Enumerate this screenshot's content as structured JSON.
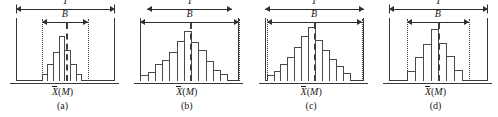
{
  "figure": {
    "title": "",
    "axis_label_mean": "X",
    "axis_label_paren_open": "(",
    "axis_label_m": "M",
    "axis_label_paren_close": ")",
    "tolerance_label": "T",
    "spread_label": "B"
  },
  "chart_data": {
    "type": "bar",
    "title": "",
    "xlabel": "X̄ (M)",
    "ylabel": "",
    "grid": false,
    "legend": "none",
    "panels": [
      {
        "caption": "(a)",
        "tolerance_label": "T",
        "spread_label": "B",
        "tolerance_span_pct": 100,
        "spread_span_pct": 47,
        "spread_left_pct": 26,
        "mean_pos_pct": 50,
        "values": [
          12,
          30,
          52,
          80,
          55,
          30,
          12
        ],
        "ylim": [
          0,
          100
        ],
        "note": "process spread B much narrower than tolerance T"
      },
      {
        "caption": "(b)",
        "tolerance_label": "T",
        "spread_label": "B",
        "tolerance_span_pct": 86,
        "spread_span_pct": 100,
        "spread_left_pct": 0,
        "mean_pos_pct": 50,
        "values": [
          10,
          16,
          30,
          38,
          52,
          72,
          90,
          70,
          55,
          36,
          20,
          12
        ],
        "ylim": [
          0,
          100
        ],
        "note": "process spread B exceeds tolerance T"
      },
      {
        "caption": "(c)",
        "tolerance_label": "T",
        "spread_label": "B",
        "tolerance_span_pct": 100,
        "spread_span_pct": 96,
        "spread_left_pct": 2,
        "mean_pos_pct": 50,
        "values": [
          10,
          18,
          30,
          42,
          60,
          80,
          96,
          74,
          56,
          40,
          26,
          14
        ],
        "ylim": [
          0,
          100
        ],
        "note": "process spread B almost equals tolerance T"
      },
      {
        "caption": "(d)",
        "tolerance_label": "T",
        "spread_label": "B",
        "tolerance_span_pct": 100,
        "spread_span_pct": 63,
        "spread_left_pct": 18,
        "mean_pos_pct": 50,
        "values": [
          18,
          42,
          66,
          92,
          68,
          44,
          20
        ],
        "ylim": [
          0,
          100
        ],
        "note": "process spread B moderately narrower than tolerance T"
      }
    ]
  }
}
